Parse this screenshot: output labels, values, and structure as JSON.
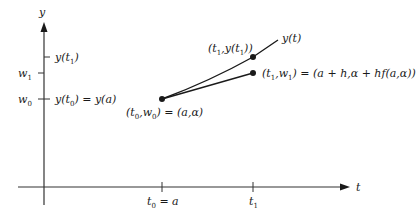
{
  "diagram": {
    "type": "euler-method-illustration",
    "axes": {
      "x_label": "t",
      "y_label": "y",
      "x_ticks": [
        "t0 = a",
        "t1"
      ],
      "y_ticks_left": [
        "w1",
        "w0"
      ],
      "y_ticks_right": [
        "y(t1)",
        "y(t0) = y(a)"
      ]
    },
    "labels": {
      "y_axis": "y",
      "t_axis": "t",
      "w1": "w",
      "w1_sub": "1",
      "w0": "w",
      "w0_sub": "0",
      "y_t1": "y(t",
      "y_t1_sub": "1",
      "y_t1_end": ")",
      "y_t0": "y(t",
      "y_t0_sub": "0",
      "y_t0_end": ") = y(a)",
      "t0": "t",
      "t0_sub": "0",
      "t0_end": " = a",
      "t1": "t",
      "t1_sub": "1",
      "curve": "y(t)",
      "point_start": "(t",
      "point_start_sub0": "0",
      "point_start_mid": ",w",
      "point_start_sub1": "0",
      "point_start_end": ") = (a,α)",
      "point_exact": "(t",
      "point_exact_sub0": "1",
      "point_exact_mid": ",y(t",
      "point_exact_sub1": "1",
      "point_exact_end": "))",
      "point_approx": "(t",
      "point_approx_sub0": "1",
      "point_approx_mid": ",w",
      "point_approx_sub1": "1",
      "point_approx_end": ") = (a + h,α + hf(a,α))"
    },
    "colors": {
      "ink": "#1a1a1a",
      "axis": "#333333"
    }
  }
}
